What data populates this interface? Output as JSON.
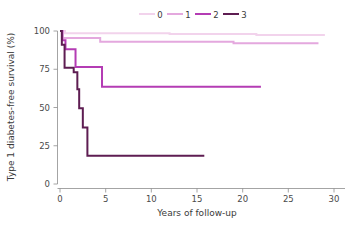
{
  "chart_data": {
    "type": "line",
    "subtype": "kaplan-meier-step",
    "title": "",
    "xlabel": "Years of follow-up",
    "ylabel": "Type 1 diabetes-free survival (%)",
    "xlim": [
      0,
      31
    ],
    "ylim": [
      0,
      103
    ],
    "xticks": [
      0,
      5,
      10,
      15,
      20,
      25,
      30
    ],
    "xticklabels": [
      "0",
      "5",
      "10",
      "15",
      "20",
      "25",
      "30"
    ],
    "yticks": [
      0,
      25,
      50,
      75,
      100
    ],
    "yticklabels": [
      "0",
      "25",
      "50",
      "75",
      "100"
    ],
    "grid": false,
    "legend_position": "top-center",
    "legend_orientation": "horizontal",
    "series": [
      {
        "name": "0",
        "label": "0",
        "color": "#f2d3ec",
        "points": [
          [
            0.0,
            100.0
          ],
          [
            0.55,
            100.0
          ],
          [
            0.55,
            98.6
          ],
          [
            12.0,
            98.6
          ],
          [
            12.0,
            98.0
          ],
          [
            21.5,
            98.0
          ],
          [
            21.5,
            97.4
          ],
          [
            29.0,
            97.4
          ]
        ]
      },
      {
        "name": "1",
        "label": "1",
        "color": "#e4a8de",
        "points": [
          [
            0.0,
            100.0
          ],
          [
            0.3,
            100.0
          ],
          [
            0.3,
            95.5
          ],
          [
            4.4,
            95.5
          ],
          [
            4.4,
            93.0
          ],
          [
            19.0,
            93.0
          ],
          [
            19.0,
            92.0
          ],
          [
            28.3,
            92.0
          ]
        ]
      },
      {
        "name": "2",
        "label": "2",
        "color": "#b43cb4",
        "points": [
          [
            0.0,
            100.0
          ],
          [
            0.25,
            100.0
          ],
          [
            0.25,
            94.0
          ],
          [
            0.6,
            94.0
          ],
          [
            0.6,
            88.0
          ],
          [
            1.7,
            88.0
          ],
          [
            1.7,
            76.5
          ],
          [
            4.6,
            76.5
          ],
          [
            4.6,
            63.5
          ],
          [
            22.0,
            63.5
          ]
        ]
      },
      {
        "name": "3",
        "label": "3",
        "color": "#5e1d52",
        "points": [
          [
            0.0,
            100.0
          ],
          [
            0.2,
            100.0
          ],
          [
            0.2,
            91.0
          ],
          [
            0.5,
            91.0
          ],
          [
            0.5,
            76.0
          ],
          [
            1.5,
            76.0
          ],
          [
            1.5,
            73.0
          ],
          [
            1.9,
            73.0
          ],
          [
            1.9,
            62.0
          ],
          [
            2.1,
            62.0
          ],
          [
            2.1,
            49.5
          ],
          [
            2.5,
            49.5
          ],
          [
            2.5,
            37.0
          ],
          [
            3.0,
            37.0
          ],
          [
            3.0,
            18.5
          ],
          [
            15.8,
            18.5
          ]
        ]
      }
    ]
  },
  "legend": {
    "entries": [
      {
        "label": "0",
        "color": "#f2d3ec"
      },
      {
        "label": "1",
        "color": "#e4a8de"
      },
      {
        "label": "2",
        "color": "#b43cb4"
      },
      {
        "label": "3",
        "color": "#5e1d52"
      }
    ]
  },
  "axes": {
    "x_title": "Years of follow-up",
    "y_title": "Type 1 diabetes-free survival (%)",
    "x_tick_labels": [
      "0",
      "5",
      "10",
      "15",
      "20",
      "25",
      "30"
    ],
    "y_tick_labels": [
      "0",
      "25",
      "50",
      "75",
      "100"
    ]
  },
  "colors": {
    "series_0": "#f2d3ec",
    "series_1": "#e4a8de",
    "series_2": "#b43cb4",
    "series_3": "#5e1d52",
    "axis": "#8d8d8d",
    "text": "#3a3a3a",
    "background": "#ffffff"
  }
}
